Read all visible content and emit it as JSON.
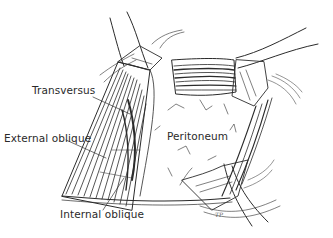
{
  "figure": {
    "labels": {
      "transversus": "Transversus",
      "external_oblique": "External oblique",
      "internal_oblique": "Internal oblique",
      "peritoneum": "Peritoneum"
    },
    "signature": "TP",
    "colors": {
      "ink": "#2a2a2a",
      "background": "#ffffff"
    }
  }
}
